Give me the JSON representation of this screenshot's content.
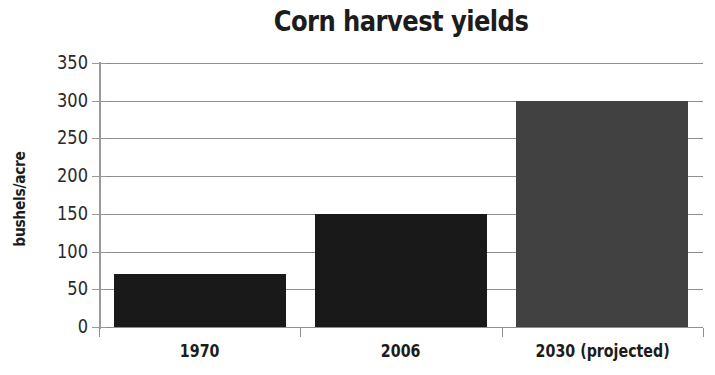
{
  "chart_data": {
    "type": "bar",
    "title": "Corn harvest yields",
    "xlabel": "",
    "ylabel": "bushels/acre",
    "categories": [
      "1970",
      "2006",
      "2030 (projected)"
    ],
    "values": [
      70,
      150,
      300
    ],
    "bar_colors": [
      "#191919",
      "#191919",
      "#414141"
    ],
    "ylim": [
      0,
      350
    ],
    "ytick_labels": [
      "350",
      "300",
      "250",
      "200",
      "150",
      "100",
      "50",
      "0"
    ],
    "ytick_values": [
      350,
      300,
      250,
      200,
      150,
      100,
      50,
      0
    ],
    "ytick_step": 50,
    "grid": true,
    "grid_axis": "y",
    "grid_color": "#8e8e8e",
    "legend": false,
    "background": "#ffffff",
    "text_color": "#1c1c1c",
    "series": [
      {
        "name": "Corn yield",
        "values": [
          70,
          150,
          300
        ]
      }
    ]
  }
}
